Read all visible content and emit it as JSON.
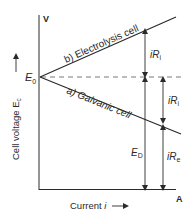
{
  "diagram": {
    "y_axis_unit": "V",
    "x_axis_unit": "A",
    "y_axis_label": "Cell voltage E",
    "y_axis_label_sub": "c",
    "x_axis_label": "Current i",
    "origin_label": "E",
    "origin_label_sub": "0",
    "line_b_label": "b) Electrolysis cell",
    "line_a_label": "a) Galvanic cell",
    "arrow_top_label": "iR",
    "arrow_top_label_sub": "i",
    "arrow_mid_label": "iR",
    "arrow_mid_label_sub": "i",
    "arrow_ed_label": "E",
    "arrow_ed_label_sub": "D",
    "arrow_bottom_label": "iR",
    "arrow_bottom_label_sub": "e",
    "colors": {
      "line": "#2a2a2a",
      "dashed": "#555555"
    }
  }
}
